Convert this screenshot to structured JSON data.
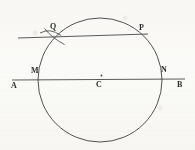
{
  "figure": {
    "kind": "geometry-construction-diagram",
    "background_color": "#fbfbf9",
    "ink_color": "#3a3a3a",
    "label_color": "#2b2b2b"
  },
  "labels": {
    "A": "A",
    "B": "B",
    "C": "C",
    "M": "M",
    "N": "N",
    "P": "P",
    "Q": "Q"
  },
  "geometry": {
    "circle": {
      "name": "main-circle",
      "center_x": 100,
      "center_y": 80,
      "radius": 62
    },
    "center_dot": {
      "name": "center-point-dot",
      "x": 101,
      "y": 75,
      "radius": 1
    },
    "line_AB": {
      "name": "line-ab",
      "x1": 12,
      "y1": 80,
      "x2": 185,
      "y2": 79
    },
    "line_QP": {
      "name": "line-qp",
      "x1": 18,
      "y1": 38,
      "x2": 148,
      "y2": 34
    },
    "arc_mark_1": {
      "name": "construction-arc-upper",
      "d": "M 40 33 Q 50 27 60 35"
    },
    "arc_mark_2": {
      "name": "construction-arc-lower",
      "d": "M 44 28 Q 52 38 64 44"
    },
    "points": {
      "M": {
        "x": 39,
        "y": 80
      },
      "N": {
        "x": 161,
        "y": 79
      },
      "P": {
        "x": 145,
        "y": 34
      },
      "Q": {
        "x": 54,
        "y": 36
      },
      "C": {
        "x": 100,
        "y": 80
      }
    }
  },
  "label_positions": {
    "A": {
      "left": 11,
      "top": 82
    },
    "B": {
      "left": 177,
      "top": 81
    },
    "C": {
      "left": 96,
      "top": 81
    },
    "M": {
      "left": 31,
      "top": 67
    },
    "N": {
      "left": 161,
      "top": 66
    },
    "P": {
      "left": 139,
      "top": 24
    },
    "Q": {
      "left": 50,
      "top": 23
    }
  }
}
